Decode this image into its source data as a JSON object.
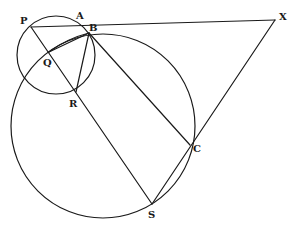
{
  "diagram": {
    "title": "",
    "stroke_color": "#1a1a1a",
    "background": "#ffffff",
    "points": {
      "P": {
        "label": "P",
        "x": 31,
        "y": 27,
        "lx": 20,
        "ly": 24
      },
      "A": {
        "label": "A",
        "x": 80,
        "y": 24,
        "lx": 76,
        "ly": 19
      },
      "B": {
        "label": "B",
        "x": 89,
        "y": 33,
        "lx": 89,
        "ly": 31
      },
      "Q": {
        "label": "Q",
        "x": 49,
        "y": 52,
        "lx": 43,
        "ly": 66
      },
      "R": {
        "label": "R",
        "x": 76,
        "y": 92,
        "lx": 69,
        "ly": 107
      },
      "X": {
        "label": "X",
        "x": 275,
        "y": 20,
        "lx": 279,
        "ly": 20
      },
      "C": {
        "label": "C",
        "x": 190,
        "y": 145,
        "lx": 193,
        "ly": 152
      },
      "S": {
        "label": "S",
        "x": 152,
        "y": 204,
        "lx": 148,
        "ly": 218
      }
    },
    "circles": [
      {
        "name": "small-circle",
        "cx": 56,
        "cy": 55,
        "r": 39
      },
      {
        "name": "large-circle",
        "cx": 103,
        "cy": 126,
        "r": 92
      }
    ],
    "segments": [
      {
        "name": "segment-PX",
        "from": "P",
        "to": "X"
      },
      {
        "name": "segment-XS",
        "from": "X",
        "to": "S"
      },
      {
        "name": "segment-PS",
        "from": "P",
        "to": "S"
      },
      {
        "name": "segment-BC",
        "from": "B",
        "to": "C"
      },
      {
        "name": "segment-BR",
        "from": "B",
        "to": "R"
      },
      {
        "name": "segment-BQ",
        "from": "B",
        "to": "Q"
      }
    ]
  }
}
